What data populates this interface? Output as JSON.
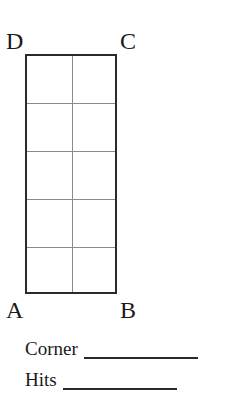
{
  "diagram": {
    "corners": {
      "D": "D",
      "C": "C",
      "A": "A",
      "B": "B"
    },
    "grid": {
      "columns": 2,
      "rows": 5
    }
  },
  "fields": {
    "corner_label": "Corner",
    "hits_label": "Hits"
  }
}
